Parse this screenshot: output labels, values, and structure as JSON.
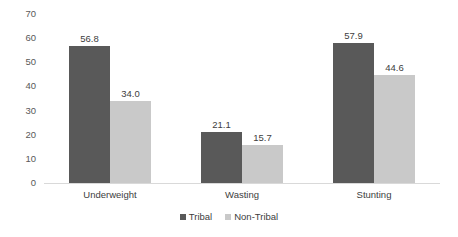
{
  "chart_data": {
    "type": "bar",
    "title": "",
    "subtitle": "",
    "xlabel": "",
    "ylabel": "",
    "categories": [
      "Underweight",
      "Wasting",
      "Stunting"
    ],
    "series": [
      {
        "name": "Tribal",
        "color": "#595959",
        "values": [
          56.8,
          21.1,
          57.9
        ],
        "labels": [
          "56.8",
          "21.1",
          "57.9"
        ]
      },
      {
        "name": "Non-Tribal",
        "color": "#c9c9c9",
        "values": [
          34.0,
          15.7,
          44.6
        ],
        "labels": [
          "34.0",
          "15.7",
          "44.6"
        ]
      }
    ],
    "ylim": [
      0,
      70
    ],
    "ytick_values": [
      70,
      60,
      50,
      40,
      30,
      20,
      10,
      0
    ],
    "ytick_labels": [
      "70",
      "60",
      "50",
      "40",
      "30",
      "20",
      "10",
      "0"
    ],
    "grid": false,
    "axis_line_color": "#d9d9d9",
    "legend_position": "bottom",
    "data_labels_shown": true
  }
}
